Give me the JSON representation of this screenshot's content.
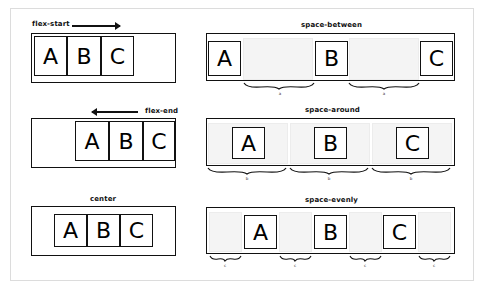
{
  "panels": {
    "flex_start": {
      "label": "flex-start",
      "arrow": "right",
      "items": [
        "A",
        "B",
        "C"
      ]
    },
    "flex_end": {
      "label": "flex-end",
      "arrow": "left",
      "items": [
        "A",
        "B",
        "C"
      ]
    },
    "center": {
      "label": "center",
      "items": [
        "A",
        "B",
        "C"
      ]
    },
    "space_between": {
      "label": "space-between",
      "items": [
        "A",
        "B",
        "C"
      ],
      "gap_label": "a",
      "gap_labels": [
        "a",
        "a"
      ]
    },
    "space_around": {
      "label": "space-around",
      "items": [
        "A",
        "B",
        "C"
      ],
      "gap_label": "b",
      "gap_labels": [
        "b",
        "b",
        "b"
      ]
    },
    "space_evenly": {
      "label": "space-evenly",
      "items": [
        "A",
        "B",
        "C"
      ],
      "gap_label": "c",
      "gap_labels": [
        "c",
        "c",
        "c",
        "c"
      ]
    }
  },
  "colors": {
    "stroke": "#111111",
    "gap_fill": "#f4f4f4",
    "frame_border": "#dcdcdc",
    "background": "#ffffff"
  }
}
